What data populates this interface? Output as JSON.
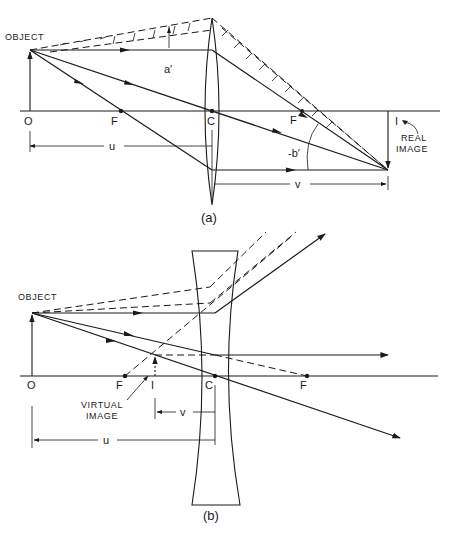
{
  "diagram_a": {
    "caption": "(a)",
    "object_label": "OBJECT",
    "points": {
      "O": "O",
      "F_left": "F",
      "C": "C",
      "F_right": "F",
      "I": "I"
    },
    "angle_a": "a′",
    "angle_b": "-b′",
    "dim_u": "u",
    "dim_v": "v",
    "image_label_line1": "REAL",
    "image_label_line2": "IMAGE",
    "lens_type": "converging (convex)"
  },
  "diagram_b": {
    "caption": "(b)",
    "object_label": "OBJECT",
    "points": {
      "O": "O",
      "F_left": "F",
      "I": "I",
      "C": "C",
      "F_right": "F"
    },
    "dim_u": "u",
    "dim_v": "v",
    "image_label_line1": "VIRTUAL",
    "image_label_line2": "IMAGE",
    "lens_type": "diverging (concave)"
  },
  "colors": {
    "ink": "#1a1a1a",
    "paper": "#ffffff"
  }
}
